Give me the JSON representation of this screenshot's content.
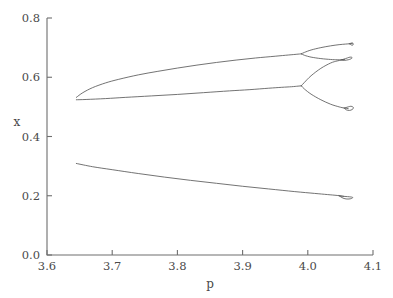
{
  "chart_data": {
    "type": "line",
    "title": "",
    "subtitle": "",
    "xlabel": "p",
    "ylabel": "x",
    "xlim": [
      3.6,
      4.1
    ],
    "ylim": [
      0.0,
      0.8
    ],
    "xticks": [
      3.6,
      3.7,
      3.8,
      3.9,
      4.0,
      4.1
    ],
    "xtick_labels": [
      "3.6",
      "3.7",
      "3.8",
      "3.9",
      "4.0",
      "4.1"
    ],
    "yticks": [
      0.0,
      0.2,
      0.4,
      0.6,
      0.8
    ],
    "ytick_labels": [
      "0.0",
      "0.2",
      "0.4",
      "0.6",
      "0.8"
    ],
    "grid": false,
    "legend": null,
    "legend_position": "none",
    "line_color": "#5a5a5a",
    "axis_color": "#6e6e6e",
    "background": "#ffffff",
    "annotations": [],
    "series": [
      {
        "name": "upper-branch-period-1",
        "comment": "Upper stable branch from saddle-node fold rising toward x = 0.68",
        "x": [
          3.645,
          3.655,
          3.67,
          3.69,
          3.71,
          3.74,
          3.77,
          3.8,
          3.83,
          3.86,
          3.89,
          3.92,
          3.95,
          3.97,
          3.985,
          3.99
        ],
        "values": [
          0.532,
          0.548,
          0.565,
          0.581,
          0.593,
          0.608,
          0.62,
          0.631,
          0.641,
          0.65,
          0.658,
          0.665,
          0.671,
          0.675,
          0.678,
          0.679
        ]
      },
      {
        "name": "middle-branch-period-1",
        "comment": "Middle (saddle) branch from the same fold rising slowly toward x = 0.57",
        "x": [
          3.645,
          3.66,
          3.69,
          3.72,
          3.76,
          3.8,
          3.84,
          3.88,
          3.91,
          3.94,
          3.96,
          3.975,
          3.985,
          3.99
        ],
        "values": [
          0.524,
          0.525,
          0.528,
          0.532,
          0.537,
          0.542,
          0.548,
          0.554,
          0.558,
          0.563,
          0.566,
          0.568,
          0.57,
          0.571
        ]
      },
      {
        "name": "lower-branch-period-1",
        "comment": "Lower stable branch descending from x = 0.31 toward x = 0.195",
        "x": [
          3.645,
          3.67,
          3.7,
          3.74,
          3.78,
          3.82,
          3.86,
          3.9,
          3.94,
          3.98,
          4.01,
          4.03,
          4.045,
          4.055
        ],
        "values": [
          0.309,
          0.298,
          0.288,
          0.275,
          0.263,
          0.252,
          0.242,
          0.232,
          0.223,
          0.214,
          0.208,
          0.204,
          0.201,
          0.198
        ]
      },
      {
        "name": "upper-period-2-upper",
        "comment": "Upper arm of first period-doubling of the upper branch",
        "x": [
          3.99,
          3.995,
          4.005,
          4.02,
          4.035,
          4.048,
          4.058,
          4.064,
          4.068
        ],
        "values": [
          0.679,
          0.684,
          0.692,
          0.7,
          0.706,
          0.71,
          0.712,
          0.713,
          0.714
        ]
      },
      {
        "name": "upper-period-2-lower",
        "comment": "Lower arm of first period-doubling of the upper branch",
        "x": [
          3.99,
          3.995,
          4.005,
          4.02,
          4.035,
          4.045,
          4.052,
          4.056
        ],
        "values": [
          0.679,
          0.674,
          0.668,
          0.663,
          0.66,
          0.659,
          0.659,
          0.66
        ]
      },
      {
        "name": "middle-period-2-upper",
        "comment": "Upper arm leaving the middle branch at p = 3.99 toward the small loop",
        "x": [
          3.99,
          3.995,
          4.005,
          4.02,
          4.035,
          4.045,
          4.052,
          4.056
        ],
        "values": [
          0.571,
          0.583,
          0.605,
          0.63,
          0.648,
          0.655,
          0.658,
          0.659
        ]
      },
      {
        "name": "middle-period-2-lower",
        "comment": "Lower arm leaving the middle branch at p = 3.99 descending to the lower loop",
        "x": [
          3.99,
          3.995,
          4.005,
          4.02,
          4.035,
          4.048,
          4.056,
          4.062
        ],
        "values": [
          0.571,
          0.56,
          0.543,
          0.524,
          0.509,
          0.5,
          0.496,
          0.494
        ]
      },
      {
        "name": "loop-upper-right",
        "comment": "Small closed loop (period-4 bubble) near p = 4.06, x = 0.66",
        "x": [
          4.052,
          4.058,
          4.063,
          4.066,
          4.068,
          4.066,
          4.062,
          4.056,
          4.052
        ],
        "values": [
          0.659,
          0.663,
          0.667,
          0.668,
          0.666,
          0.662,
          0.659,
          0.657,
          0.659
        ]
      },
      {
        "name": "loop-lower-right",
        "comment": "Small closed loop (period-4 bubble) near p = 4.062, x = 0.49",
        "x": [
          4.056,
          4.062,
          4.066,
          4.069,
          4.07,
          4.068,
          4.064,
          4.059,
          4.056
        ],
        "values": [
          0.496,
          0.5,
          0.502,
          0.5,
          0.496,
          0.491,
          0.488,
          0.49,
          0.496
        ]
      },
      {
        "name": "loop-lower-branch-bubble",
        "comment": "Narrow period-doubling bubble on the lower branch near p = 4.06, x = 0.19",
        "x": [
          4.048,
          4.055,
          4.061,
          4.066,
          4.069,
          4.066,
          4.06,
          4.054,
          4.048
        ],
        "values": [
          0.2,
          0.198,
          0.197,
          0.196,
          0.194,
          0.19,
          0.189,
          0.192,
          0.2
        ]
      },
      {
        "name": "upper-cascade-tip",
        "comment": "Dense cascade tip at the right edge of the upper period-2 branch",
        "x": [
          4.064,
          4.068,
          4.07,
          4.068,
          4.064
        ],
        "values": [
          0.713,
          0.716,
          0.712,
          0.708,
          0.713
        ]
      }
    ]
  },
  "figure": {
    "x_axis_label": "p",
    "y_axis_label": "x"
  }
}
